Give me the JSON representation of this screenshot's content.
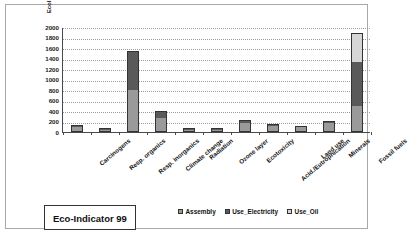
{
  "chart_data": {
    "type": "bar",
    "title": "Eco-Indicator 99",
    "xlabel": "",
    "ylabel": "EcoIndicator99 [Pt]",
    "ylim": [
      0,
      2000
    ],
    "yticks": [
      0,
      200,
      400,
      600,
      800,
      1000,
      1200,
      1400,
      1600,
      1800,
      2000
    ],
    "grid": true,
    "stacked": true,
    "legend_position": "bottom-right",
    "categories": [
      "Carcinogens",
      "Resp. organics",
      "Resp. inorganics",
      "Climate change",
      "Radiation",
      "Ozone layer",
      "Ecotoxicity",
      "Acid./Eutrophication",
      "Land use",
      "Minerals",
      "Fossil fuels"
    ],
    "series": [
      {
        "name": "Assembly",
        "color": "#9a9a9a",
        "values": [
          75,
          18,
          780,
          250,
          12,
          10,
          155,
          90,
          70,
          145,
          480
        ]
      },
      {
        "name": "Use_Electricity",
        "color": "#5a5a5a",
        "values": [
          25,
          4,
          720,
          110,
          5,
          3,
          45,
          10,
          5,
          30,
          840
        ]
      },
      {
        "name": "Use_Oil",
        "color": "#d6d6d6",
        "values": [
          0,
          0,
          0,
          0,
          0,
          0,
          0,
          0,
          0,
          0,
          520
        ]
      }
    ],
    "totals": [
      100,
      22,
      1500,
      360,
      17,
      13,
      200,
      100,
      75,
      175,
      1840
    ]
  },
  "legend": {
    "items": [
      {
        "label": "Assembly",
        "color": "#9a9a9a"
      },
      {
        "label": "Use_Electricity",
        "color": "#5a5a5a"
      },
      {
        "label": "Use_Oil",
        "color": "#d6d6d6"
      }
    ]
  }
}
